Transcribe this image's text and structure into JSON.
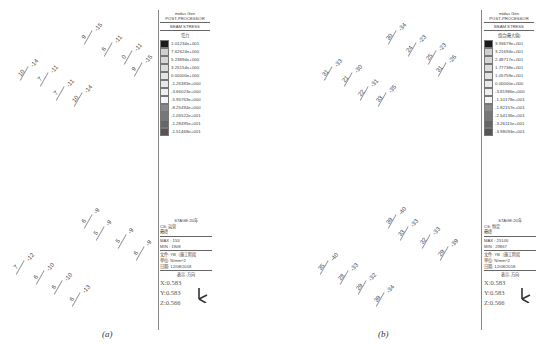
{
  "figure": {
    "captions": [
      "(a)",
      "(b)"
    ]
  },
  "panels": [
    {
      "id": "a",
      "legend": {
        "software": "midas Gen",
        "module": "POST-PROCESSOR",
        "result_type": "BEAM STRESS",
        "component": "弯力",
        "values": [
          "1.01234e+001",
          "7.62624e+000",
          "5.23894e+000",
          "3.25154e+000",
          "0.00000e+000",
          "-1.26383e+000",
          "-3.66023e+000",
          "-5.95763e+000",
          "-8.25494e+000",
          "-1.05522e+001",
          "-1.28495e+001",
          "-1.51468e+001"
        ],
        "colors": [
          "#1a1a1a",
          "#cfcfcf",
          "#d6d6d6",
          "#dcdcdc",
          "#e4e4e4",
          "#e9e9e9",
          "#efefef",
          "#f4f4f4",
          "#888888",
          "#777777",
          "#666666",
          "#555555"
        ]
      },
      "info": {
        "stage": "STAGE:20年",
        "cs": "CS: 运营",
        "type": "最终",
        "max": "MAX : 153",
        "min": "MIN : 1908",
        "file": "文件: YB（施工阶段",
        "unit": "单位: N/mm^2",
        "date": "日期: 12/08/2018",
        "view": "表示-方向",
        "x": "X:0.583",
        "y": "Y:0.583",
        "z": "Z:0.566"
      },
      "beam_labels_top": [
        "-15",
        "9",
        "-11",
        "6",
        "-11",
        "0",
        "-15",
        "9",
        "-14",
        "10",
        "-11",
        "7",
        "-11",
        "7",
        "-14",
        "10"
      ],
      "beam_labels_bottom": [
        "-9",
        "6",
        "-9",
        "5",
        "-9",
        "5",
        "-9",
        "6",
        "-12",
        "7",
        "-10",
        "6",
        "-10",
        "6",
        "-13",
        "6"
      ]
    },
    {
      "id": "b",
      "legend": {
        "software": "midas Gen",
        "module": "POST-PROCESSOR",
        "result_type": "BEAM STRESS",
        "component": "组合(最大值)",
        "values": [
          "3.93679e+001",
          "3.21694e+001",
          "2.48717e+001",
          "1.77738e+001",
          "1.05759e+001",
          "0.00000e+000",
          "-3.81986e+000",
          "-1.10178e+001",
          "-1.82157e+001",
          "-2.54136e+001",
          "-3.26115e+001",
          "-3.98094e+001"
        ],
        "colors": [
          "#1a1a1a",
          "#cfcfcf",
          "#d6d6d6",
          "#dcdcdc",
          "#e4e4e4",
          "#e9e9e9",
          "#efefef",
          "#f4f4f4",
          "#888888",
          "#777777",
          "#666666",
          "#555555"
        ]
      },
      "info": {
        "stage": "STAGE:20年",
        "cs": "CS: 恒定",
        "type": "最终",
        "max": "MAX : 25146",
        "min": "MIN : 29867",
        "file": "文件: YB（施工阶段",
        "unit": "单位: N/mm^2",
        "date": "日期: 12/08/2018",
        "view": "表示-方向",
        "x": "X:0.583",
        "y": "Y:0.583",
        "z": "Z:0.566"
      },
      "beam_labels_top": [
        "-34",
        "30",
        "-23",
        "24",
        "-23",
        "25",
        "-26",
        "31",
        "-33",
        "31",
        "-30",
        "21",
        "-31",
        "22",
        "-35",
        "33"
      ],
      "beam_labels_bottom": [
        "-40",
        "39",
        "-33",
        "33",
        "-33",
        "32",
        "-39",
        "29",
        "-40",
        "35",
        "-33",
        "28",
        "-32",
        "29",
        "-34",
        "39"
      ]
    }
  ]
}
